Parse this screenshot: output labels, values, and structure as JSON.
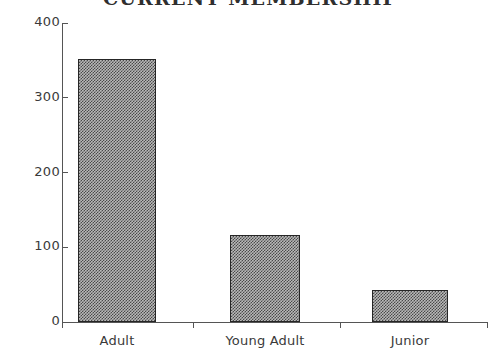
{
  "chart_data": {
    "type": "bar",
    "title": "CURRENT MEMBERSHIP",
    "xlabel": "",
    "ylabel": "",
    "categories": [
      "Adult",
      "Young Adult",
      "Junior"
    ],
    "values": [
      352,
      116,
      43
    ],
    "ylim": [
      0,
      400
    ],
    "ytick_labels": [
      "0",
      "100",
      "200",
      "300",
      "400"
    ],
    "ytick_values": [
      0,
      100,
      200,
      300,
      400
    ],
    "grid": false,
    "legend": null,
    "bar_fill": "#4a4a4a",
    "bar_edge": "#262626",
    "axis_color": "#555555",
    "background": "#ffffff"
  }
}
